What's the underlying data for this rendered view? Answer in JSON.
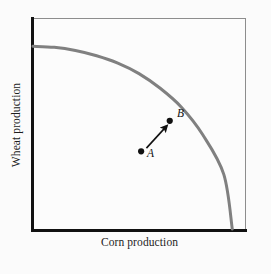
{
  "figure": {
    "kind": "production-possibilities-frontier",
    "background_color": "#fbfbfb",
    "plot_background_color": "#fcfcfc"
  },
  "axes": {
    "y_title": "Wheat production",
    "x_title": "Corn production",
    "axis_color": "#111111",
    "frame_color": "#8d8d8d"
  },
  "annotations": {
    "point_a_label": "A",
    "point_b_label": "B",
    "point_color": "#111111",
    "arrow_color": "#111111"
  },
  "chart_data": {
    "type": "line",
    "title": "",
    "subtitle": "",
    "xlabel": "Corn production",
    "ylabel": "Wheat production",
    "xlim": [
      0,
      1
    ],
    "ylim": [
      0,
      1
    ],
    "grid": false,
    "legend": "none",
    "tick_labels": {
      "x": [],
      "y": []
    },
    "curve_color": "#808080",
    "curve_width_px": 3,
    "series": [
      {
        "name": "Production possibilities frontier",
        "description": "Concave-to-origin frontier from the wheat intercept on the vertical axis to the corn intercept on the horizontal axis",
        "x": [
          0.0,
          0.1,
          0.2,
          0.3,
          0.4,
          0.5,
          0.6,
          0.7,
          0.8,
          0.9,
          0.94
        ],
        "y": [
          0.87,
          0.865,
          0.85,
          0.825,
          0.79,
          0.74,
          0.67,
          0.58,
          0.45,
          0.26,
          0.0
        ]
      }
    ],
    "points": [
      {
        "label": "A",
        "x": 0.51,
        "y": 0.37,
        "on_frontier": false,
        "note": "inefficient point inside the frontier"
      },
      {
        "label": "B",
        "x": 0.645,
        "y": 0.515,
        "on_frontier": true,
        "note": "efficient point on the frontier"
      }
    ],
    "arrows": [
      {
        "from_label": "A",
        "to_label": "B",
        "from": [
          0.535,
          0.385
        ],
        "to": [
          0.63,
          0.49
        ],
        "note": "movement from inefficient point A to efficient point B"
      }
    ]
  }
}
